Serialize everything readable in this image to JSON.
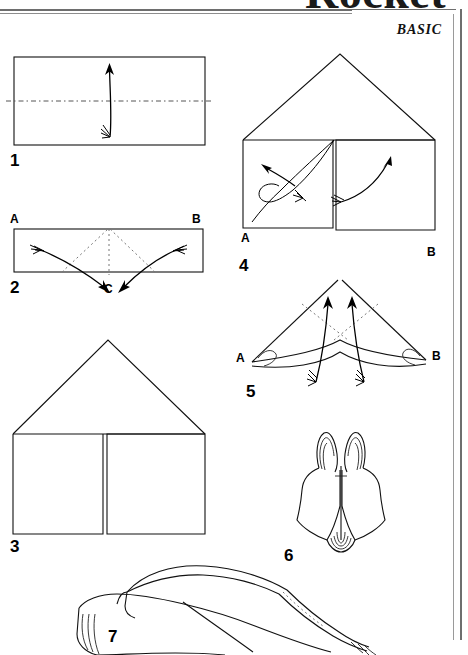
{
  "page": {
    "title": "Rocket",
    "subtitle": "BASIC",
    "background_color": "#ffffff",
    "ink_color": "#000000",
    "rule_color": "#6e6e6e",
    "type": "origami-folding-instructions",
    "steps_visible": 7
  },
  "steps": [
    {
      "number": "1",
      "shape": "rectangle",
      "description": "Rectangle with horizontal center valley-fold line; arrow folds bottom edge up to top edge.",
      "fold_line": "horizontal-center-dash-dot",
      "arrow": "up",
      "labels": []
    },
    {
      "number": "2",
      "shape": "folded-rectangle",
      "description": "Folded rectangle with corners A and B; dotted diagonal fold lines and center line; two curved arrows bring A and B down to point C.",
      "fold_line": "diagonal-dotted-plus-center",
      "arrow": "two-curved-inward-down",
      "labels": [
        "A",
        "B",
        "C"
      ]
    },
    {
      "number": "3",
      "shape": "house",
      "description": "House shape: triangular roof over a rectangle split vertically into two panels.",
      "fold_line": "vertical-center-split",
      "arrow": "none",
      "labels": []
    },
    {
      "number": "4",
      "shape": "house",
      "description": "House shape with corners A and B; curved arrows lift the lower panels up toward the center peak.",
      "fold_line": "vertical-center-split",
      "arrow": "two-curved-up-to-peak",
      "labels": [
        "A",
        "B"
      ]
    },
    {
      "number": "5",
      "shape": "dart",
      "description": "Wide dart/arrowhead shape with tips A and B; dotted fold lines and two straight arrows folding flaps upward.",
      "fold_line": "dotted-inner-diagonals",
      "arrow": "two-straight-up",
      "labels": [
        "A",
        "B"
      ]
    },
    {
      "number": "6",
      "shape": "rocket-body-3d",
      "description": "Three-dimensional view of the assembled rocket with two pointed fins at top and a rounded tail.",
      "fold_line": "none",
      "arrow": "none",
      "labels": []
    },
    {
      "number": "7",
      "shape": "rocket-finished-3d",
      "description": "Large three-dimensional view of the finished rocket, cropped at the bottom edge of the page.",
      "fold_line": "none",
      "arrow": "none",
      "labels": []
    }
  ]
}
